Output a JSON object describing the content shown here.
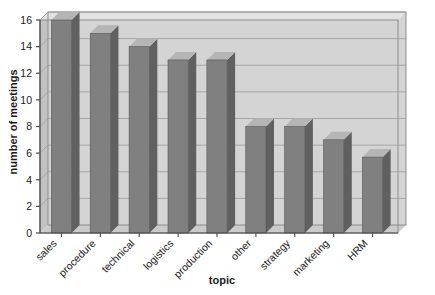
{
  "chart_data": {
    "type": "bar",
    "title": "",
    "subtitle": "",
    "xlabel": "topic",
    "ylabel": "number of meetings",
    "categories": [
      "sales",
      "procedure",
      "technical",
      "logistics",
      "production",
      "other",
      "strategy",
      "marketing",
      "HRM"
    ],
    "values": [
      16,
      15,
      14,
      13,
      13,
      8,
      8,
      7,
      5.7
    ],
    "ylim": [
      0,
      16
    ],
    "yticks": [
      0,
      2,
      4,
      6,
      8,
      10,
      12,
      14,
      16
    ],
    "ytick_labels": [
      "0",
      "2",
      "4",
      "6",
      "8",
      "10",
      "12",
      "14",
      "16"
    ],
    "grid": true,
    "grid_axis": "y",
    "legend": false,
    "legend_position": "none",
    "style": "3d-bars",
    "colors": {
      "bar_front": "#808080",
      "bar_side": "#606060",
      "bar_top": "#b5b5b5",
      "plot_background": "#d4d4d4",
      "gridline": "#9a9a9a",
      "axis": "#4a4a4a",
      "wall_left": "#c0c0c0",
      "floor": "#cccccc",
      "text": "#202020",
      "page_background": "#ffffff"
    }
  },
  "axes": {
    "y_title": "number of meetings",
    "x_title": "topic"
  }
}
